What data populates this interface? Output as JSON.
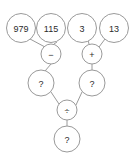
{
  "diagram": {
    "type": "binary-expression-tree",
    "background_color": "#ffffff",
    "stroke_color": "#9a9a9a",
    "text_color": "#2b2b2b",
    "nodes": {
      "leaf_1": {
        "label": "979",
        "role": "operand",
        "cx": 21,
        "cy": 28,
        "r": 14.5
      },
      "leaf_2": {
        "label": "115",
        "role": "operand",
        "cx": 51,
        "cy": 28,
        "r": 14.5
      },
      "leaf_3": {
        "label": "3",
        "role": "operand",
        "cx": 82,
        "cy": 28,
        "r": 14.5
      },
      "leaf_4": {
        "label": "13",
        "role": "operand",
        "cx": 114,
        "cy": 28,
        "r": 14.5
      },
      "op_left": {
        "label": "−",
        "role": "operator-minus",
        "cx": 51,
        "cy": 54,
        "r": 10
      },
      "op_right": {
        "label": "+",
        "role": "operator-plus",
        "cx": 92,
        "cy": 54,
        "r": 10
      },
      "result_left": {
        "label": "?",
        "role": "unknown-result",
        "cx": 41,
        "cy": 83,
        "r": 13
      },
      "result_right": {
        "label": "?",
        "role": "unknown-result",
        "cx": 92,
        "cy": 83,
        "r": 13
      },
      "op_root": {
        "label": "÷",
        "role": "operator-divide",
        "cx": 67,
        "cy": 110,
        "r": 10
      },
      "result_root": {
        "label": "?",
        "role": "unknown-result",
        "cx": 67,
        "cy": 139,
        "r": 13
      }
    },
    "edges": [
      {
        "from": "leaf_1",
        "to": "op_left"
      },
      {
        "from": "leaf_2",
        "to": "op_left"
      },
      {
        "from": "leaf_3",
        "to": "op_right"
      },
      {
        "from": "leaf_4",
        "to": "op_right"
      },
      {
        "from": "op_left",
        "to": "result_left"
      },
      {
        "from": "op_right",
        "to": "result_right"
      },
      {
        "from": "result_left",
        "to": "op_root"
      },
      {
        "from": "result_right",
        "to": "op_root"
      },
      {
        "from": "op_root",
        "to": "result_root"
      }
    ]
  }
}
